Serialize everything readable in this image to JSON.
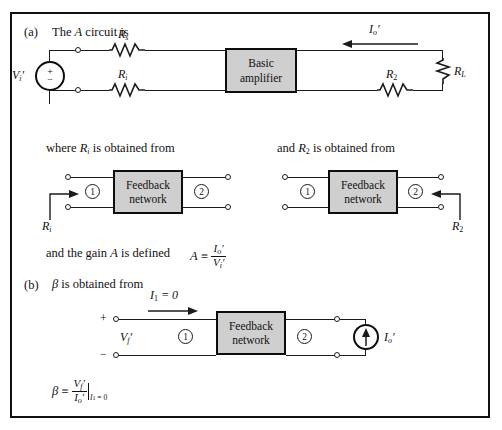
{
  "figure": {
    "type": "circuit-diagram",
    "topic": "Feedback amplifier A circuit and beta network (transresistance/current-shunt style)",
    "border_color": "#111111",
    "box_fill": "#cfcfcf",
    "wire_color": "#1b1b1b"
  },
  "part_a": {
    "label": "(a)",
    "caption": "The A circuit is",
    "caption_italic_symbol": "A",
    "source": {
      "name": "V'_i",
      "base": "V",
      "sub": "i",
      "prime": true,
      "plus": "+",
      "minus": "−"
    },
    "resistors": [
      {
        "name": "R_s",
        "base": "R",
        "sub": "s",
        "orientation": "horizontal"
      },
      {
        "name": "R_i",
        "base": "R",
        "sub": "i",
        "orientation": "horizontal"
      },
      {
        "name": "R_2",
        "base": "R",
        "sub": "2",
        "orientation": "horizontal"
      },
      {
        "name": "R_L",
        "base": "R",
        "sub": "L",
        "orientation": "vertical"
      }
    ],
    "amplifier_block": {
      "line1": "Basic",
      "line2": "amplifier"
    },
    "output_current": {
      "name": "I'_o",
      "base": "I",
      "sub": "o",
      "prime": true,
      "arrow_direction": "left"
    }
  },
  "mid_left": {
    "caption_pre": "where ",
    "caption_symbol": "R",
    "caption_sub": "i",
    "caption_post": " is obtained from",
    "block": {
      "line1": "Feedback",
      "line2": "network"
    },
    "port_left": "1",
    "port_right": "2",
    "arrow_label": {
      "base": "R",
      "sub": "i"
    },
    "arrow_direction": "right"
  },
  "mid_right": {
    "caption_pre": "and ",
    "caption_symbol": "R",
    "caption_sub": "2",
    "caption_post": " is obtained from",
    "block": {
      "line1": "Feedback",
      "line2": "network"
    },
    "port_left": "1",
    "port_right": "2",
    "arrow_label": {
      "base": "R",
      "sub": "2"
    },
    "arrow_direction": "left"
  },
  "gain_line": {
    "text": "and the gain A is defined",
    "text_pre": "and the gain ",
    "text_symbol": "A",
    "text_post": " is defined",
    "definition": {
      "lhs": "A",
      "relation": "≡",
      "numerator": "I'_o",
      "numerator_base": "I",
      "numerator_sub": "o",
      "numerator_prime": true,
      "denominator": "V'_i",
      "denominator_base": "V",
      "denominator_sub": "i",
      "denominator_prime": true
    }
  },
  "part_b": {
    "label": "(b)",
    "caption_symbol": "β",
    "caption": " is obtained from",
    "input_current": {
      "base": "I",
      "sub": "1",
      "equals": "= 0",
      "arrow_direction": "right"
    },
    "input_voltage": {
      "base": "V",
      "sub": "f",
      "prime": true,
      "plus": "+",
      "minus": "−"
    },
    "block": {
      "line1": "Feedback",
      "line2": "network"
    },
    "port_left": "1",
    "port_right": "2",
    "current_source": {
      "base": "I",
      "sub": "o",
      "prime": true,
      "arrow_direction": "up"
    },
    "definition": {
      "lhs": "β",
      "relation": "≡",
      "numerator_base": "V",
      "numerator_sub": "f",
      "numerator_prime": true,
      "denominator_base": "I",
      "denominator_sub": "o",
      "denominator_prime": true,
      "condition": "I₁ = 0",
      "condition_base": "I",
      "condition_sub": "1",
      "condition_value": "= 0"
    }
  }
}
